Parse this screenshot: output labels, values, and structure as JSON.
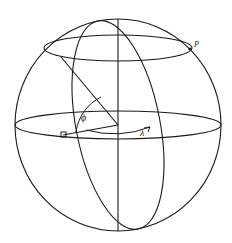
{
  "figure": {
    "background_color": "#ffffff",
    "stroke_color": "#1a1a1a",
    "width": 232,
    "height": 243
  },
  "labels": {
    "point_p": "P",
    "angle_phi": "ϕ",
    "angle_lambda": "λ"
  },
  "geometry": {
    "sphere": {
      "center_x": 118,
      "center_y": 125,
      "radius_x": 103,
      "radius_y": 106
    },
    "polar_axis": {
      "x": 118,
      "y_top": 19,
      "y_bottom": 231
    },
    "equator": {
      "center_x": 118,
      "center_y": 125,
      "radius_x": 103,
      "radius_y": 14
    },
    "latitude_circle": {
      "center_x": 118,
      "center_y": 48,
      "radius_x": 74,
      "radius_y": 13
    },
    "meridian": {
      "center_x": 118,
      "center_y": 125,
      "radius_x": 42,
      "radius_y": 106,
      "rotation_deg": -11
    },
    "radius_vector": {
      "from_x": 118,
      "from_y": 125,
      "to_x": 61,
      "to_y": 57
    },
    "ground_projection": {
      "from_x": 118,
      "from_y": 125,
      "to_x": 63,
      "to_y": 135
    },
    "point_p_marker": {
      "x": 190,
      "y": 49
    },
    "square_marker": {
      "x": 63,
      "y": 135,
      "size": 5
    }
  },
  "icons": {
    "phi_arc": "arc-icon",
    "lambda_arc": "arc-icon"
  }
}
